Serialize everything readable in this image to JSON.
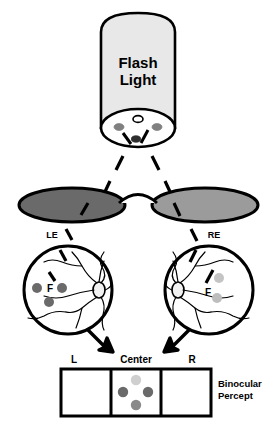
{
  "figure": {
    "title_lines": [
      "Flash",
      "Light"
    ],
    "source_label": "Flash Light"
  },
  "light_source": {
    "body_fill": "#e8e8e8",
    "outline": "#000000",
    "cap_fill": "#ffffff",
    "emitters": [
      {
        "name": "center-white-bulb",
        "color": "#ffffff"
      },
      {
        "name": "left-gray-bulb",
        "color": "#808080"
      },
      {
        "name": "right-gray-bulb",
        "color": "#808080"
      },
      {
        "name": "bottom-black-bulb",
        "color": "#3b3b3b"
      }
    ]
  },
  "eyes": [
    {
      "side": "LE",
      "label": "LE",
      "lens_fill": "#6a6a6a",
      "fovea_label": "F",
      "dots": [
        {
          "name": "dot-left-of-fovea",
          "color": "#6a6a6a"
        },
        {
          "name": "dot-right-of-fovea",
          "color": "#6a6a6a"
        },
        {
          "name": "dot-below-fovea",
          "color": "#6a6a6a"
        }
      ]
    },
    {
      "side": "RE",
      "label": "RE",
      "lens_fill": "#9b9b9b",
      "fovea_label": "F",
      "dots": [
        {
          "name": "dot-above-fovea",
          "color": "#c4c4c4"
        },
        {
          "name": "dot-below-fovea",
          "color": "#bdbdbd"
        }
      ]
    }
  ],
  "percept": {
    "caption_lines": [
      "Binocular",
      "Percept"
    ],
    "caption": "Binocular Percept",
    "cells": [
      {
        "position_label": "L",
        "name": "left-cell",
        "dots": []
      },
      {
        "position_label": "Center",
        "name": "center-cell",
        "dots": [
          {
            "name": "percept-dot-top",
            "color": "#cfcfcf"
          },
          {
            "name": "percept-dot-left",
            "color": "#6a6a6a"
          },
          {
            "name": "percept-dot-right",
            "color": "#6a6a6a"
          },
          {
            "name": "percept-dot-bottom",
            "color": "#8a8a8a"
          }
        ]
      },
      {
        "position_label": "R",
        "name": "right-cell",
        "dots": []
      }
    ]
  },
  "colors": {
    "background": "#ffffff",
    "stroke": "#000000",
    "flashlight_body": "#e8e8e8",
    "left_lens": "#6a6a6a",
    "right_lens": "#9b9b9b"
  }
}
